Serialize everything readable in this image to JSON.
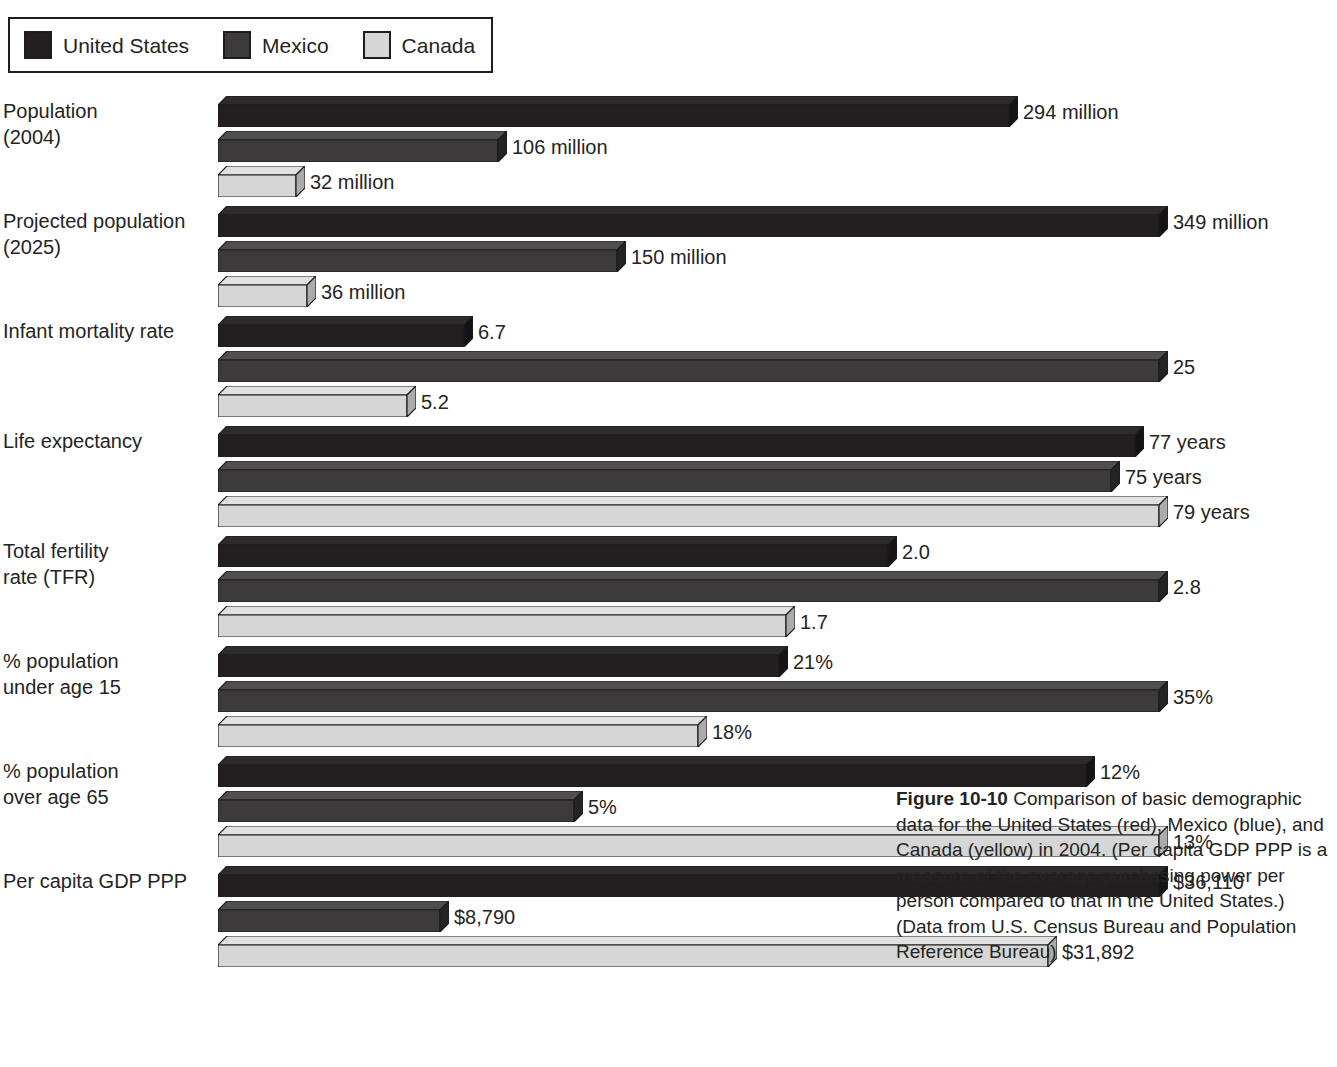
{
  "legend": {
    "items": [
      {
        "label": "United States",
        "color": "#231f20",
        "key": "us"
      },
      {
        "label": "Mexico",
        "color": "#3c3a3b",
        "key": "mx"
      },
      {
        "label": "Canada",
        "color": "#d6d6d6",
        "key": "ca"
      }
    ]
  },
  "caption": {
    "figure_number": "Figure 10-10",
    "text": "  Comparison of basic demographic data for the United States (red), Mexico (blue), and Canada (yellow) in 2004. (Per capita GDP PPP is a measure of the average purchasing power per person compared to that in the United States.) (Data from U.S. Census Bureau and Population Reference Bureau)"
  },
  "chart_data": {
    "type": "bar",
    "orientation": "horizontal",
    "xlabel": "",
    "ylabel": "",
    "grid": false,
    "legend_position": "top-left",
    "series_names": [
      "United States",
      "Mexico",
      "Canada"
    ],
    "series_colors": [
      "#231f20",
      "#3c3a3b",
      "#d6d6d6"
    ],
    "categories": [
      "Population (2004)",
      "Projected population (2025)",
      "Infant mortality rate",
      "Life expectancy",
      "Total fertility rate (TFR)",
      "% population under age 15",
      "% population over age 65",
      "Per capita GDP PPP"
    ],
    "groups": [
      {
        "label": "Population\n(2004)",
        "max": 349,
        "bars": [
          {
            "series": "United States",
            "value": 294,
            "label": "294 million"
          },
          {
            "series": "Mexico",
            "value": 106,
            "label": "106 million"
          },
          {
            "series": "Canada",
            "value": 32,
            "label": "32 million"
          }
        ]
      },
      {
        "label": "Projected population\n(2025)",
        "max": 349,
        "bars": [
          {
            "series": "United States",
            "value": 349,
            "label": "349 million"
          },
          {
            "series": "Mexico",
            "value": 150,
            "label": "150 million"
          },
          {
            "series": "Canada",
            "value": 36,
            "label": "36 million"
          }
        ]
      },
      {
        "label": "Infant mortality rate",
        "max": 25,
        "bars": [
          {
            "series": "United States",
            "value": 6.7,
            "label": "6.7"
          },
          {
            "series": "Mexico",
            "value": 25,
            "label": "25"
          },
          {
            "series": "Canada",
            "value": 5.2,
            "label": "5.2"
          }
        ]
      },
      {
        "label": "Life expectancy",
        "max": 79,
        "bars": [
          {
            "series": "United States",
            "value": 77,
            "label": "77 years"
          },
          {
            "series": "Mexico",
            "value": 75,
            "label": "75 years"
          },
          {
            "series": "Canada",
            "value": 79,
            "label": "79 years"
          }
        ]
      },
      {
        "label": "Total fertility\nrate (TFR)",
        "max": 2.8,
        "bars": [
          {
            "series": "United States",
            "value": 2.0,
            "label": "2.0"
          },
          {
            "series": "Mexico",
            "value": 2.8,
            "label": "2.8"
          },
          {
            "series": "Canada",
            "value": 1.7,
            "label": "1.7"
          }
        ]
      },
      {
        "label": "% population\nunder age 15",
        "max": 35,
        "bars": [
          {
            "series": "United States",
            "value": 21,
            "label": "21%"
          },
          {
            "series": "Mexico",
            "value": 35,
            "label": "35%"
          },
          {
            "series": "Canada",
            "value": 18,
            "label": "18%"
          }
        ]
      },
      {
        "label": "% population\nover age 65",
        "max": 13,
        "bars": [
          {
            "series": "United States",
            "value": 12,
            "label": "12%"
          },
          {
            "series": "Mexico",
            "value": 5,
            "label": "5%"
          },
          {
            "series": "Canada",
            "value": 13,
            "label": "13%"
          }
        ]
      },
      {
        "label": "Per capita GDP PPP",
        "max": 36110,
        "bars": [
          {
            "series": "United States",
            "value": 36110,
            "label": "$36,110"
          },
          {
            "series": "Mexico",
            "value": 8790,
            "label": "$8,790"
          },
          {
            "series": "Canada",
            "value": 31892,
            "label": "$31,892"
          }
        ]
      }
    ]
  }
}
